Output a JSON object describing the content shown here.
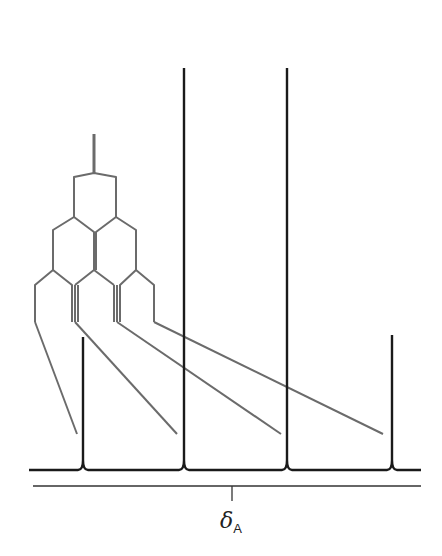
{
  "diagram": {
    "type": "NMR splitting tree (multiplet)",
    "colors": {
      "spectrum": "#1a1a1a",
      "tree": "#6b6b6b",
      "axis": "#333333"
    },
    "peaks": [
      {
        "x": 83,
        "top": 337
      },
      {
        "x": 184,
        "top": 68
      },
      {
        "x": 287,
        "top": 68
      },
      {
        "x": 392,
        "top": 335
      }
    ],
    "baseline_y": 470,
    "axis": {
      "y": 486,
      "x1": 33,
      "x2": 421,
      "tick_x": 232
    },
    "chemical_shift_label": {
      "symbol": "δ",
      "subscript": "A"
    }
  }
}
